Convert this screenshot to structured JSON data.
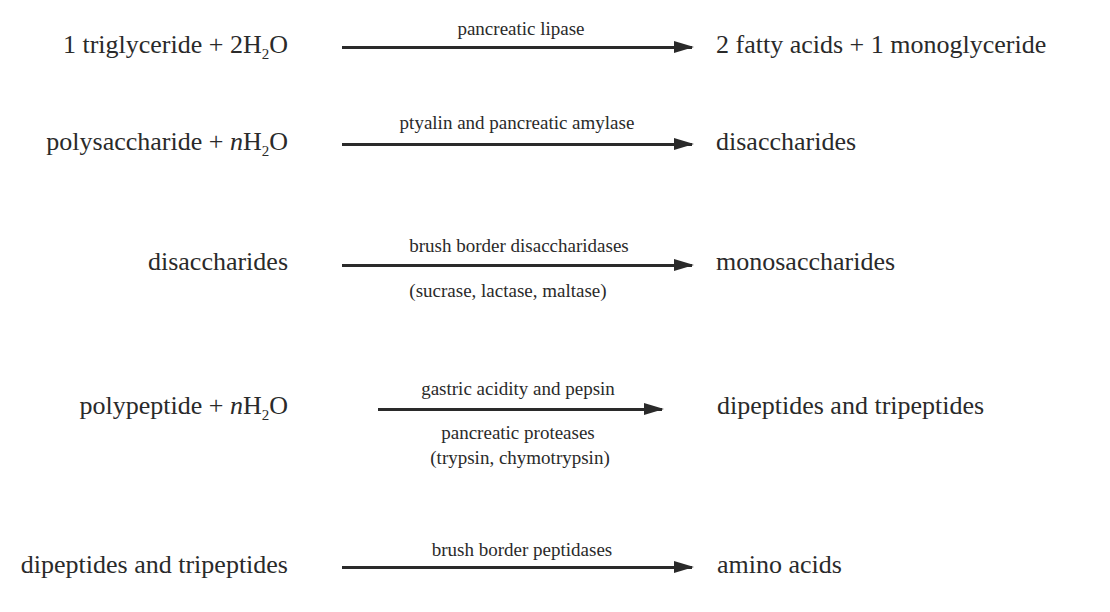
{
  "diagram": {
    "title": "",
    "reactions": [
      {
        "reactant": {
          "prefix": "1 triglyceride + 2H",
          "subscript": "2",
          "suffix": "O",
          "coef_italic": ""
        },
        "enzyme_above": "pancreatic lipase",
        "enzyme_below": [],
        "product": "2 fatty acids + 1 monoglyceride"
      },
      {
        "reactant": {
          "prefix": "polysaccharide + ",
          "coef_italic": "n",
          "prefix2": "H",
          "subscript": "2",
          "suffix": "O"
        },
        "enzyme_above": "ptyalin and pancreatic amylase",
        "enzyme_below": [],
        "product": "disaccharides"
      },
      {
        "reactant": {
          "text": "disaccharides"
        },
        "enzyme_above": "brush border disaccharidases",
        "enzyme_below": [
          "(sucrase, lactase, maltase)"
        ],
        "product": "monosaccharides"
      },
      {
        "reactant": {
          "prefix": "polypeptide + ",
          "coef_italic": "n",
          "prefix2": "H",
          "subscript": "2",
          "suffix": "O"
        },
        "enzyme_above": "gastric acidity and pepsin",
        "enzyme_below": [
          "pancreatic proteases",
          "(trypsin, chymotrypsin)"
        ],
        "product": "dipeptides and tripeptides"
      },
      {
        "reactant": {
          "text": "dipeptides and tripeptides"
        },
        "enzyme_above": "brush border peptidases",
        "enzyme_below": [],
        "product": "amino acids"
      }
    ],
    "colors": {
      "text": "#2a2a2a",
      "arrow": "#2a2a2a",
      "background": "#ffffff"
    }
  }
}
